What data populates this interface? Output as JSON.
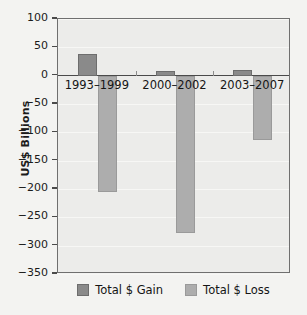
{
  "chart_data": {
    "type": "bar",
    "title": "",
    "xlabel": "",
    "ylabel": "US$ Billions",
    "ylim": [
      -350,
      100
    ],
    "ytick_values": [
      100,
      50,
      0,
      -50,
      -100,
      -150,
      -200,
      -250,
      -300,
      -350
    ],
    "ytick_labels": [
      "100",
      "50",
      "0",
      "−50",
      "−100",
      "−150",
      "−200",
      "−250",
      "−300",
      "−350"
    ],
    "grid": true,
    "legend_position": "bottom",
    "categories": [
      "1993–1999",
      "2000–2002",
      "2003–2007"
    ],
    "series": [
      {
        "name": "Total $ Gain",
        "color": "#8a8a8a",
        "values": [
          38,
          9,
          10
        ]
      },
      {
        "name": "Total $ Loss",
        "color": "#adadad",
        "values": [
          -205,
          -278,
          -113
        ]
      }
    ]
  },
  "axis": {
    "ylabel": "US$ Billions"
  },
  "legend": {
    "items": [
      {
        "label": "Total $ Gain"
      },
      {
        "label": "Total $ Loss"
      }
    ]
  },
  "watermark": {
    "text": "WORKS IN NUMBERS"
  }
}
